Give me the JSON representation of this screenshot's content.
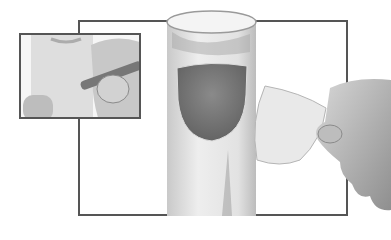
{
  "scene": {
    "description": "Craft instruction illustration: cardboard tube with cut-out window; inset shows pencil tracing; hand holds cut-out piece",
    "colors": {
      "frame": "#555555",
      "tube": "#e6e6e6",
      "tube_shadow": "#bdbdbd",
      "window": "#7a7a7a",
      "skin": "#cfcfcf",
      "skin_shadow": "#8a8a8a",
      "pencil": "#777777",
      "background": "#ffffff"
    },
    "panels": [
      {
        "name": "inset-step",
        "content": "pencil tracing outline on tube"
      },
      {
        "name": "main-step",
        "content": "tube with cut window, hand holding removed piece"
      }
    ]
  }
}
